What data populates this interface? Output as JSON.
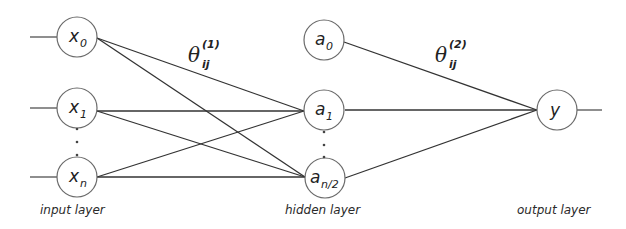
{
  "diagram": {
    "type": "neural-network",
    "colors": {
      "background": "#ffffff",
      "edge": "#333333",
      "node_stroke": "#6a6a6a",
      "text": "#222222"
    },
    "layers": [
      {
        "id": "input",
        "label": "input layer",
        "nodes": [
          {
            "id": "x0",
            "symbol": "x",
            "sub": "0"
          },
          {
            "id": "x1",
            "symbol": "x",
            "sub": "1"
          },
          {
            "id": "xn",
            "symbol": "x",
            "sub": "n"
          }
        ]
      },
      {
        "id": "hidden",
        "label": "hidden layer",
        "nodes": [
          {
            "id": "a0",
            "symbol": "a",
            "sub": "0"
          },
          {
            "id": "a1",
            "symbol": "a",
            "sub": "1"
          },
          {
            "id": "an2",
            "symbol": "a",
            "sub": "n/2"
          }
        ]
      },
      {
        "id": "output",
        "label": "output layer",
        "nodes": [
          {
            "id": "y",
            "symbol": "y",
            "sub": ""
          }
        ]
      }
    ],
    "weights": [
      {
        "symbol": "θ",
        "sup": "(1)",
        "sub": "ij",
        "between": "input-hidden"
      },
      {
        "symbol": "θ",
        "sup": "(2)",
        "sub": "ij",
        "between": "hidden-output"
      }
    ],
    "edges": [
      {
        "from": "x0",
        "to": "a1"
      },
      {
        "from": "x0",
        "to": "an2"
      },
      {
        "from": "x1",
        "to": "a1"
      },
      {
        "from": "x1",
        "to": "an2"
      },
      {
        "from": "xn",
        "to": "a1"
      },
      {
        "from": "xn",
        "to": "an2"
      },
      {
        "from": "a0",
        "to": "y"
      },
      {
        "from": "a1",
        "to": "y"
      },
      {
        "from": "an2",
        "to": "y"
      }
    ],
    "ellipsis": "⋮"
  }
}
